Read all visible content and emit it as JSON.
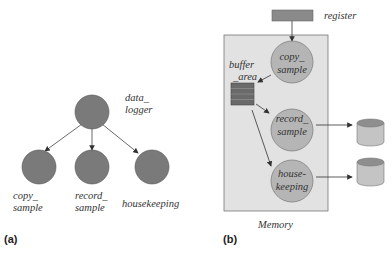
{
  "panel_a": {
    "label": "(a)",
    "root": {
      "name_line1": "data_",
      "name_line2": "logger"
    },
    "children": [
      {
        "line1": "copy_",
        "line2": "sample"
      },
      {
        "line1": "record_",
        "line2": "sample"
      },
      {
        "line1": "housekeeping",
        "line2": ""
      }
    ]
  },
  "panel_b": {
    "label": "(b)",
    "register_label": "register",
    "memory_label": "Memory",
    "buffer": {
      "line1": "buffer",
      "line2": "_area"
    },
    "processes": [
      {
        "line1": "copy_",
        "line2": "sample"
      },
      {
        "line1": "record_",
        "line2": "sample"
      },
      {
        "line1": "house-",
        "line2": "keeping"
      }
    ]
  },
  "colors": {
    "node_fill_a": "#7a7a7a",
    "node_fill_b": "#b5b5b5",
    "memory_fill": "#e2e2e2",
    "register_fill": "#8a8a8a",
    "buffer_fill": "#6a6a6a",
    "cylinder_body": "#c4c4c4",
    "cylinder_top": "#8e8e8e"
  }
}
